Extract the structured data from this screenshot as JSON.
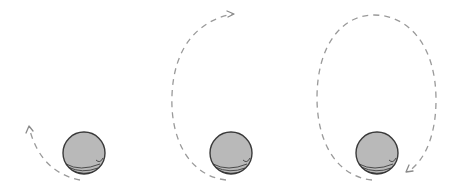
{
  "figure": {
    "description": "Three stages of an orbit: a ball with a dashed trajectory that grows from a short arc, to a half loop, to a nearly complete elliptical loop",
    "panels": [
      {
        "id": "stage-1",
        "ball": {
          "cx": 84,
          "cy": 153,
          "r": 21
        },
        "trajectory": "short-arc",
        "arrow_direction": "up-left"
      },
      {
        "id": "stage-2",
        "ball": {
          "cx": 231,
          "cy": 153,
          "r": 21
        },
        "trajectory": "half-loop",
        "arrow_direction": "right"
      },
      {
        "id": "stage-3",
        "ball": {
          "cx": 377,
          "cy": 153,
          "r": 21
        },
        "trajectory": "near-full-loop",
        "arrow_direction": "down-left"
      }
    ],
    "colors": {
      "background": "#ffffff",
      "ball_fill": "#b9b9b9",
      "ball_outline": "#3a3a3a",
      "trajectory": "#9a9a9a"
    }
  }
}
